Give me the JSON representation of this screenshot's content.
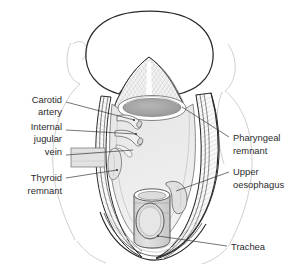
{
  "figure": {
    "width": 299,
    "height": 270,
    "background_color": "#ffffff",
    "line_color": "#2a2a2a",
    "faint_line_color": "#c9c9c9",
    "cavity_fill": "#ececec",
    "pharynx_fill": "#a9a9a9",
    "trachea_fill": "#d8d8d8",
    "text_color": "#2b2b2b"
  },
  "labels": {
    "carotid_artery": {
      "lines": [
        "Carotid",
        "artery"
      ],
      "side": "left",
      "text_x": 62,
      "text_y": 103,
      "leader_start_x": 66,
      "leader_start_y": 102,
      "leader_end_x": 134,
      "leader_end_y": 120
    },
    "internal_jugular_vein": {
      "lines": [
        "Internal",
        "jugular",
        "vein"
      ],
      "side": "left",
      "text_x": 62,
      "text_y": 130,
      "leader_start_x": 66,
      "leader_start_y": 130,
      "leader_end_x": 136,
      "leader_end_y": 134
    },
    "thyroid_remnant": {
      "lines": [
        "Thyroid",
        "remnant"
      ],
      "side": "left",
      "text_x": 62,
      "text_y": 181,
      "leader_start_x": 66,
      "leader_start_y": 178,
      "leader_end_x": 117,
      "leader_end_y": 170
    },
    "pharyngeal_remnant": {
      "lines": [
        "Pharyngeal",
        "remnant"
      ],
      "side": "right",
      "text_x": 233,
      "text_y": 141,
      "leader_start_x": 229,
      "leader_start_y": 137,
      "leader_end_x": 182,
      "leader_end_y": 107
    },
    "upper_oesophagus": {
      "lines": [
        "Upper",
        "oesophagus"
      ],
      "side": "right",
      "text_x": 233,
      "text_y": 175,
      "leader_start_x": 229,
      "leader_start_y": 172,
      "leader_end_x": 176,
      "leader_end_y": 191
    },
    "trachea": {
      "lines": [
        "Trachea"
      ],
      "side": "right",
      "text_x": 231,
      "text_y": 250,
      "leader_start_x": 227,
      "leader_start_y": 246,
      "leader_end_x": 158,
      "leader_end_y": 236
    }
  },
  "structures": {
    "head": "head-and-chin-outline",
    "shoulder_left": "left-shoulder-outline",
    "shoulder_right": "right-shoulder-outline",
    "tongue_base": "tongue-base-wedge",
    "pharyngeal_opening": "pharyngeal-opening-ellipse",
    "cavity": "neck-cavity",
    "skin_flap_left": "left-skin-flap",
    "skin_flap_right": "right-skin-flap",
    "carotid_stump": "carotid-artery-stump",
    "jugular_stump": "internal-jugular-vein-stump",
    "thyroid_remnant_shape": "thyroid-remnant-lobe",
    "oesophagus": "upper-oesophagus-wall",
    "trachea_shape": "trachea-stoma-cylinder"
  }
}
